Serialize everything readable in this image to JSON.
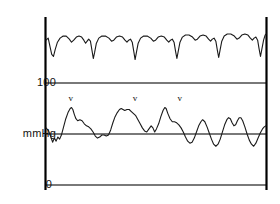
{
  "figure": {
    "title": "",
    "background_color": "#ffffff",
    "trace_color": "#1a1a1a",
    "grid_color": "#4d4d4d",
    "axis_color": "#000000"
  },
  "axis": {
    "unit_label": "mmHg",
    "tick_100": "100",
    "tick_0": "0"
  },
  "annotations": {
    "marker_glyph": "v",
    "marker_1": "v",
    "marker_2": "v",
    "marker_3": "v"
  },
  "chart_data": {
    "type": "line",
    "title": "",
    "subtitle": "",
    "xlabel": "",
    "ylabel": "mmHg",
    "grid": true,
    "legend_position": "none",
    "ylim": [
      0,
      160
    ],
    "xlim": [
      0,
      100
    ],
    "yticks": [
      0,
      100
    ],
    "ytick_labels": [
      "0",
      "mmHg",
      "100"
    ],
    "gridlines_y": [
      0,
      75,
      100
    ],
    "annotations": [
      {
        "label": "v",
        "x": 11.3,
        "y": 75,
        "note": "v wave"
      },
      {
        "label": "v",
        "x": 40.4,
        "y": 75,
        "note": "v wave"
      },
      {
        "label": "v",
        "x": 60.8,
        "y": 75,
        "note": "v wave"
      }
    ],
    "series": [
      {
        "name": "upper trace",
        "color": "#1a1a1a",
        "points": [
          [
            0.0,
            142
          ],
          [
            1.0,
            144
          ],
          [
            1.8,
            136
          ],
          [
            2.6,
            128
          ],
          [
            3.4,
            126
          ],
          [
            4.2,
            133
          ],
          [
            5.2,
            140
          ],
          [
            6.4,
            144
          ],
          [
            7.8,
            146
          ],
          [
            9.2,
            146
          ],
          [
            10.6,
            143
          ],
          [
            11.6,
            140
          ],
          [
            12.6,
            142
          ],
          [
            13.8,
            145
          ],
          [
            15.0,
            146
          ],
          [
            16.2,
            145
          ],
          [
            17.2,
            142
          ],
          [
            18.0,
            139
          ],
          [
            18.7,
            141
          ],
          [
            19.4,
            143
          ],
          [
            20.2,
            141
          ],
          [
            20.9,
            132
          ],
          [
            21.5,
            124
          ],
          [
            22.1,
            130
          ],
          [
            22.9,
            139
          ],
          [
            24.0,
            144
          ],
          [
            25.4,
            146
          ],
          [
            27.0,
            146
          ],
          [
            28.6,
            144
          ],
          [
            29.8,
            141
          ],
          [
            30.8,
            142
          ],
          [
            32.0,
            145
          ],
          [
            33.4,
            146
          ],
          [
            34.8,
            145
          ],
          [
            35.9,
            142
          ],
          [
            36.8,
            140
          ],
          [
            37.6,
            142
          ],
          [
            38.4,
            143
          ],
          [
            39.2,
            140
          ],
          [
            39.9,
            131
          ],
          [
            40.5,
            123
          ],
          [
            41.1,
            130
          ],
          [
            41.9,
            139
          ],
          [
            43.0,
            144
          ],
          [
            44.4,
            146
          ],
          [
            46.0,
            146
          ],
          [
            47.6,
            144
          ],
          [
            48.8,
            141
          ],
          [
            49.8,
            142
          ],
          [
            51.0,
            145
          ],
          [
            52.4,
            146
          ],
          [
            53.8,
            145
          ],
          [
            54.9,
            142
          ],
          [
            55.8,
            140
          ],
          [
            56.6,
            142
          ],
          [
            57.4,
            143
          ],
          [
            58.2,
            140
          ],
          [
            58.9,
            131
          ],
          [
            59.5,
            124
          ],
          [
            60.1,
            131
          ],
          [
            60.9,
            140
          ],
          [
            62.0,
            145
          ],
          [
            63.4,
            147
          ],
          [
            65.0,
            147
          ],
          [
            66.6,
            145
          ],
          [
            67.8,
            142
          ],
          [
            68.8,
            143
          ],
          [
            70.0,
            146
          ],
          [
            71.4,
            147
          ],
          [
            72.8,
            146
          ],
          [
            73.9,
            143
          ],
          [
            74.8,
            141
          ],
          [
            75.6,
            143
          ],
          [
            76.4,
            144
          ],
          [
            77.2,
            141
          ],
          [
            77.9,
            132
          ],
          [
            78.5,
            125
          ],
          [
            79.1,
            132
          ],
          [
            79.9,
            141
          ],
          [
            81.0,
            146
          ],
          [
            82.4,
            148
          ],
          [
            84.0,
            148
          ],
          [
            85.6,
            146
          ],
          [
            86.8,
            143
          ],
          [
            87.8,
            144
          ],
          [
            89.0,
            147
          ],
          [
            90.4,
            148
          ],
          [
            91.8,
            147
          ],
          [
            92.9,
            144
          ],
          [
            93.8,
            142
          ],
          [
            94.6,
            144
          ],
          [
            95.4,
            145
          ],
          [
            96.2,
            142
          ],
          [
            96.9,
            133
          ],
          [
            97.5,
            126
          ],
          [
            98.1,
            133
          ],
          [
            98.9,
            142
          ],
          [
            99.6,
            147
          ],
          [
            100.0,
            148
          ]
        ]
      },
      {
        "name": "lower trace",
        "color": "#1a1a1a",
        "points": [
          [
            0.0,
            56
          ],
          [
            1.2,
            53
          ],
          [
            2.2,
            47
          ],
          [
            3.0,
            42
          ],
          [
            3.8,
            46
          ],
          [
            4.6,
            43
          ],
          [
            5.4,
            47
          ],
          [
            6.2,
            45
          ],
          [
            7.0,
            49
          ],
          [
            8.0,
            57
          ],
          [
            9.0,
            65
          ],
          [
            10.0,
            71
          ],
          [
            11.0,
            75
          ],
          [
            11.6,
            76
          ],
          [
            12.2,
            74
          ],
          [
            12.9,
            69
          ],
          [
            13.6,
            65
          ],
          [
            14.4,
            63
          ],
          [
            15.4,
            64
          ],
          [
            16.4,
            63
          ],
          [
            17.4,
            60
          ],
          [
            18.4,
            58
          ],
          [
            19.4,
            57
          ],
          [
            20.4,
            55
          ],
          [
            21.4,
            52
          ],
          [
            22.4,
            48
          ],
          [
            23.4,
            46
          ],
          [
            24.4,
            47
          ],
          [
            25.4,
            49
          ],
          [
            26.4,
            49
          ],
          [
            27.4,
            48
          ],
          [
            28.4,
            49
          ],
          [
            29.4,
            54
          ],
          [
            30.4,
            61
          ],
          [
            31.4,
            67
          ],
          [
            32.4,
            71
          ],
          [
            33.4,
            74
          ],
          [
            34.2,
            75
          ],
          [
            35.0,
            74
          ],
          [
            35.8,
            73
          ],
          [
            36.8,
            74
          ],
          [
            37.8,
            74
          ],
          [
            38.8,
            72
          ],
          [
            39.8,
            70
          ],
          [
            40.8,
            68
          ],
          [
            41.8,
            64
          ],
          [
            42.8,
            60
          ],
          [
            43.8,
            56
          ],
          [
            44.8,
            53
          ],
          [
            45.8,
            52
          ],
          [
            46.8,
            55
          ],
          [
            47.8,
            58
          ],
          [
            48.6,
            56
          ],
          [
            49.4,
            52
          ],
          [
            50.2,
            55
          ],
          [
            51.2,
            60
          ],
          [
            52.2,
            67
          ],
          [
            53.2,
            73
          ],
          [
            54.0,
            76
          ],
          [
            54.6,
            75
          ],
          [
            55.4,
            70
          ],
          [
            56.4,
            65
          ],
          [
            57.4,
            62
          ],
          [
            58.4,
            62
          ],
          [
            59.4,
            61
          ],
          [
            60.4,
            59
          ],
          [
            61.4,
            56
          ],
          [
            62.4,
            52
          ],
          [
            63.4,
            47
          ],
          [
            64.4,
            43
          ],
          [
            65.4,
            41
          ],
          [
            66.4,
            42
          ],
          [
            67.4,
            46
          ],
          [
            68.4,
            52
          ],
          [
            69.4,
            58
          ],
          [
            70.4,
            62
          ],
          [
            71.2,
            64
          ],
          [
            72.2,
            62
          ],
          [
            73.2,
            57
          ],
          [
            74.2,
            51
          ],
          [
            75.2,
            45
          ],
          [
            76.2,
            40
          ],
          [
            77.2,
            38
          ],
          [
            78.2,
            40
          ],
          [
            79.2,
            45
          ],
          [
            80.2,
            52
          ],
          [
            81.2,
            59
          ],
          [
            82.2,
            64
          ],
          [
            83.0,
            66
          ],
          [
            83.8,
            65
          ],
          [
            84.6,
            61
          ],
          [
            85.4,
            58
          ],
          [
            86.2,
            59
          ],
          [
            87.0,
            63
          ],
          [
            87.8,
            66
          ],
          [
            88.6,
            66
          ],
          [
            89.4,
            63
          ],
          [
            90.4,
            57
          ],
          [
            91.4,
            50
          ],
          [
            92.4,
            44
          ],
          [
            93.4,
            40
          ],
          [
            94.4,
            38
          ],
          [
            95.4,
            41
          ],
          [
            96.4,
            46
          ],
          [
            97.4,
            51
          ],
          [
            98.4,
            55
          ],
          [
            99.2,
            57
          ],
          [
            100.0,
            58
          ]
        ]
      }
    ]
  }
}
